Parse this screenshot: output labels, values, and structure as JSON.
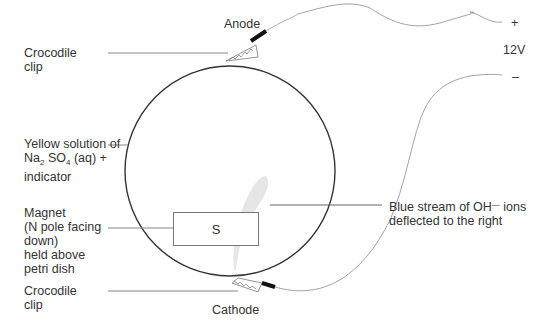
{
  "labels": {
    "anode": "Anode",
    "cathode": "Cathode",
    "plus": "+",
    "minus": "–",
    "voltage": "12V",
    "croc_top_line1": "Crocodile",
    "croc_top_line2": "clip",
    "croc_bottom_line1": "Crocodile",
    "croc_bottom_line2": "clip",
    "solution_line1": "Yellow solution of",
    "solution_na": "Na",
    "solution_na_sub": "2",
    "solution_so": " SO",
    "solution_so_sub": "4",
    "solution_rest": " (aq) +",
    "solution_line3": "indicator",
    "magnet_line1": "Magnet",
    "magnet_line2": "(N pole facing",
    "magnet_line3": "down)",
    "magnet_line4": "held above",
    "magnet_line5": "petri dish",
    "magnet_pole": "S",
    "stream_line1_a": "Blue stream of OH",
    "stream_line1_sup": "—",
    "stream_line1_b": " ions",
    "stream_line2": "deflected to the right"
  },
  "colors": {
    "outline": "#333333",
    "leader": "#888888",
    "wire": "#999999",
    "stream": "#e4e4e4"
  }
}
